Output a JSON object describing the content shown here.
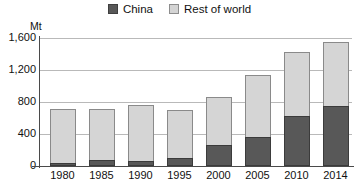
{
  "chart_data": {
    "type": "bar",
    "subtype": "stacked-vertical",
    "title": "",
    "xlabel": "",
    "ylabel": "Mt",
    "unit_label": "Mt",
    "categories": [
      "1980",
      "1985",
      "1990",
      "1995",
      "2000",
      "2005",
      "2010",
      "2014"
    ],
    "series": [
      {
        "name": "China",
        "color": "#585858",
        "values": [
          40,
          75,
          65,
          100,
          265,
          365,
          620,
          745
        ]
      },
      {
        "name": "Rest of world",
        "color": "#d5d5d5",
        "values": [
          675,
          640,
          700,
          600,
          600,
          775,
          810,
          800
        ]
      }
    ],
    "totals": [
      715,
      715,
      765,
      700,
      865,
      1140,
      1430,
      1545
    ],
    "ylim": [
      0,
      1600
    ],
    "yticks": [
      0,
      400,
      800,
      1200,
      1600
    ],
    "ytick_labels": [
      "0",
      "400",
      "800",
      "1,200",
      "1,600"
    ],
    "grid": true,
    "legend_position": "top-center"
  },
  "legend": {
    "entries": [
      {
        "label": "China",
        "swatch": "dark-gray-square"
      },
      {
        "label": "Rest of world",
        "swatch": "light-gray-square"
      }
    ]
  }
}
